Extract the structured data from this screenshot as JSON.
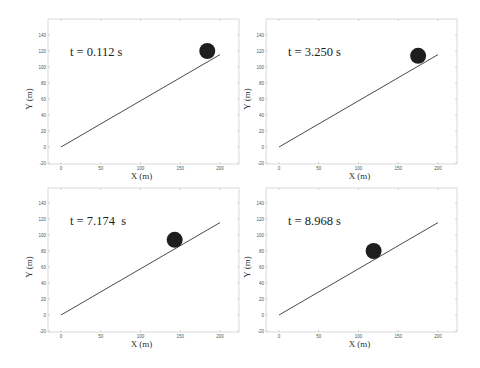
{
  "chart_data": [
    {
      "type": "scatter",
      "title": "",
      "annotation": "t = 0.112 s",
      "xlabel": "X (m)",
      "ylabel": "Y (m)",
      "xlim": [
        -10,
        225
      ],
      "ylim": [
        -20,
        160
      ],
      "xticks": [
        0,
        50,
        100,
        150,
        200
      ],
      "yticks": [
        -20,
        0,
        20,
        40,
        60,
        80,
        100,
        120,
        140
      ],
      "grid": false,
      "incline": {
        "x": [
          0,
          200
        ],
        "y": [
          0,
          115.5
        ],
        "angle_deg": 30
      },
      "ball": {
        "x": 184,
        "y": 120,
        "radius_m": 10
      }
    },
    {
      "type": "scatter",
      "title": "",
      "annotation": "t = 3.250 s",
      "xlabel": "X (m)",
      "ylabel": "Y (m)",
      "xlim": [
        -10,
        225
      ],
      "ylim": [
        -20,
        160
      ],
      "xticks": [
        0,
        50,
        100,
        150,
        200
      ],
      "yticks": [
        -20,
        0,
        20,
        40,
        60,
        80,
        100,
        120,
        140
      ],
      "grid": false,
      "incline": {
        "x": [
          0,
          200
        ],
        "y": [
          0,
          115.5
        ],
        "angle_deg": 30
      },
      "ball": {
        "x": 175,
        "y": 114,
        "radius_m": 10
      }
    },
    {
      "type": "scatter",
      "title": "",
      "annotation": "t = 7.174  s",
      "xlabel": "X (m)",
      "ylabel": "Y (m)",
      "xlim": [
        -10,
        225
      ],
      "ylim": [
        -20,
        160
      ],
      "xticks": [
        0,
        50,
        100,
        150,
        200
      ],
      "yticks": [
        -20,
        0,
        20,
        40,
        60,
        80,
        100,
        120,
        140
      ],
      "grid": false,
      "incline": {
        "x": [
          0,
          200
        ],
        "y": [
          0,
          115.5
        ],
        "angle_deg": 30
      },
      "ball": {
        "x": 143,
        "y": 94,
        "radius_m": 10
      }
    },
    {
      "type": "scatter",
      "title": "",
      "annotation": "t = 8.968 s",
      "xlabel": "X (m)",
      "ylabel": "Y (m)",
      "xlim": [
        -10,
        225
      ],
      "ylim": [
        -20,
        160
      ],
      "xticks": [
        0,
        50,
        100,
        150,
        200
      ],
      "yticks": [
        -20,
        0,
        20,
        40,
        60,
        80,
        100,
        120,
        140
      ],
      "grid": false,
      "incline": {
        "x": [
          0,
          200
        ],
        "y": [
          0,
          115.5
        ],
        "angle_deg": 30
      },
      "ball": {
        "x": 119,
        "y": 80,
        "radius_m": 10
      }
    }
  ],
  "colors": {
    "background": "#ffffff",
    "axes_frame": "#cfcfcf",
    "incline": "#4a4a4a",
    "ball": "#1e1e1e",
    "text": "#222222"
  }
}
